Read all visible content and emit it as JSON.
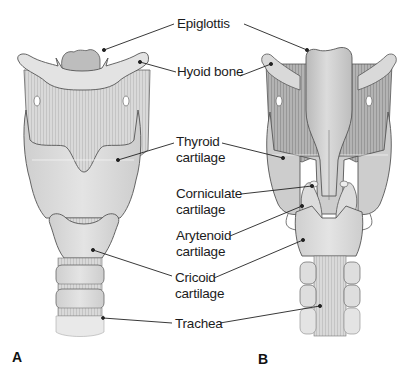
{
  "figure": {
    "panels": [
      {
        "id": "A",
        "letter": "A",
        "view": "anterior"
      },
      {
        "id": "B",
        "letter": "B",
        "view": "posterior"
      }
    ],
    "labels": {
      "epiglottis": "Epiglottis",
      "hyoid_bone": "Hyoid bone",
      "thyroid_line1": "Thyroid",
      "thyroid_line2": "cartilage",
      "corniculate_line1": "Corniculate",
      "corniculate_line2": "cartilage",
      "arytenoid_line1": "Arytenoid",
      "arytenoid_line2": "cartilage",
      "cricoid_line1": "Cricoid",
      "cricoid_line2": "cartilage",
      "trachea": "Trachea"
    },
    "colors": {
      "cartilage_light": "#e6e6e6",
      "cartilage_mid": "#d2d2d2",
      "membrane": "#c8c8c8",
      "muscle_dark": "#a9a9a9",
      "outline": "#555555",
      "leader": "#222222"
    }
  }
}
